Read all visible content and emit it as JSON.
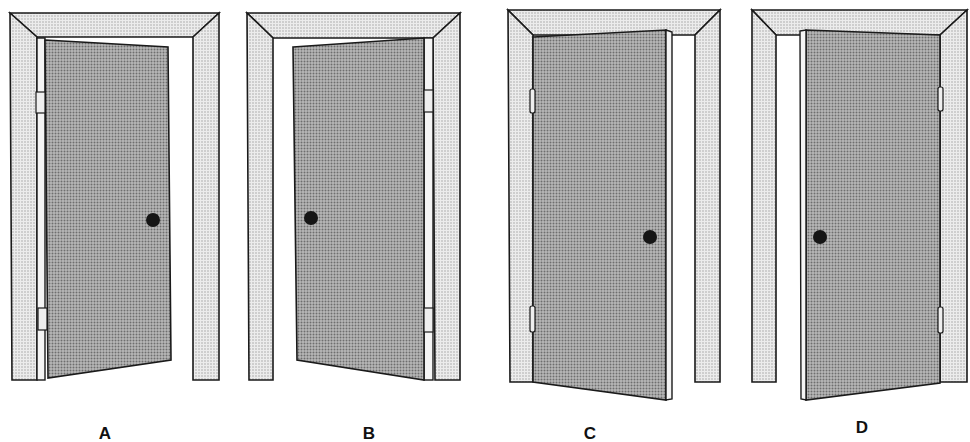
{
  "figure": {
    "doors": [
      {
        "id": "A",
        "label": "A",
        "hinge_side": "left",
        "knob_side": "right",
        "swing": "outward-left-hinged"
      },
      {
        "id": "B",
        "label": "B",
        "hinge_side": "right",
        "knob_side": "left",
        "swing": "outward-right-hinged"
      },
      {
        "id": "C",
        "label": "C",
        "hinge_side": "left",
        "knob_side": "right",
        "swing": "inward-left-hinged"
      },
      {
        "id": "D",
        "label": "D",
        "hinge_side": "right",
        "knob_side": "left",
        "swing": "inward-right-hinged"
      }
    ],
    "colors": {
      "frame_fill": "#e2e2e2",
      "door_fill": "#a9a9a9",
      "outline": "#1a1a1a",
      "knob": "#151515",
      "background": "#ffffff"
    }
  }
}
